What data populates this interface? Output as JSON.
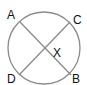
{
  "diagram": {
    "type": "circle-with-intersecting-chords",
    "circle": {
      "cx": 44,
      "cy": 48,
      "r": 36,
      "stroke": "#8a8a8a"
    },
    "chords": [
      {
        "name": "AB",
        "from": "A",
        "to": "B"
      },
      {
        "name": "CD",
        "from": "C",
        "to": "D"
      }
    ],
    "chord_color": "#8a8a8a",
    "points": {
      "A": {
        "label": "A",
        "x": 20,
        "y": 22,
        "lx": 7,
        "ly": 19
      },
      "C": {
        "label": "C",
        "x": 70,
        "y": 22,
        "lx": 74,
        "ly": 24
      },
      "D": {
        "label": "D",
        "x": 19,
        "y": 75,
        "lx": 7,
        "ly": 83
      },
      "B": {
        "label": "B",
        "x": 71,
        "y": 75,
        "lx": 73,
        "ly": 83
      }
    },
    "intersection": {
      "label": "X",
      "x": 44,
      "y": 49,
      "lx": 53,
      "ly": 57
    }
  }
}
